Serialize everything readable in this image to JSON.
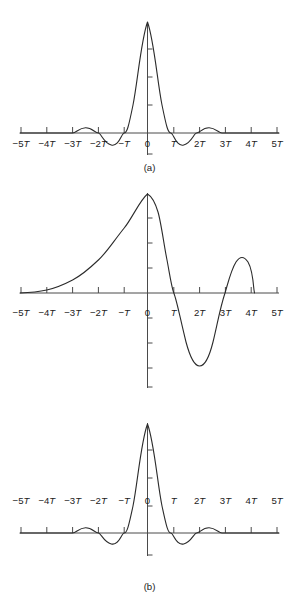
{
  "figure": {
    "panels": [
      {
        "id": "a",
        "caption": "(a)"
      },
      {
        "id": "b",
        "caption": "(b)"
      },
      {
        "id": "c",
        "caption": "(c)"
      }
    ]
  },
  "axis": {
    "tick_labels": [
      "-5T",
      "-4T",
      "-3T",
      "-2T",
      "-T",
      "0",
      "T",
      "2T",
      "3T",
      "4T",
      "5T"
    ],
    "tick_values": [
      -5,
      -4,
      -3,
      -2,
      -1,
      0,
      1,
      2,
      3,
      4,
      5
    ],
    "line_color": "#4a4a4a",
    "curve_color": "#2b2b2b"
  },
  "chart_data": [
    {
      "type": "line",
      "title": "(a)",
      "xlabel": "",
      "ylabel": "",
      "xlim": [
        -5,
        5
      ],
      "ylim": [
        -0.25,
        1.05
      ],
      "grid": false,
      "legend": "none",
      "xtick_labels": [
        "-5T",
        "-4T",
        "-3T",
        "-2T",
        "-T",
        "0",
        "T",
        "2T",
        "3T",
        "4T",
        "5T"
      ],
      "xtick_values": [
        -5,
        -4,
        -3,
        -2,
        -1,
        0,
        1,
        2,
        3,
        4,
        5
      ],
      "description": "Symmetric sinc-squared-like impulse response: main lobe peaking at 1.0 at t=0 with zero crossings near -1.15T and 1.15T, small negative sidelobes near -1.5T and 1.5T, small positive sidelobes near -2.5T and 2.5T, decaying to zero beyond 3T.",
      "x": [
        -5.0,
        -4.5,
        -4.0,
        -3.5,
        -3.0,
        -2.8,
        -2.5,
        -2.2,
        -2.0,
        -1.8,
        -1.6,
        -1.5,
        -1.3,
        -1.15,
        -1.0,
        -0.8,
        -0.6,
        -0.4,
        -0.2,
        0.0,
        0.2,
        0.4,
        0.6,
        0.8,
        1.0,
        1.15,
        1.3,
        1.5,
        1.6,
        1.8,
        2.0,
        2.2,
        2.5,
        2.8,
        3.0,
        3.5,
        4.0,
        4.5,
        5.0
      ],
      "y": [
        0.0,
        0.0,
        0.0,
        0.0,
        0.0,
        0.03,
        0.07,
        0.04,
        0.0,
        -0.06,
        -0.1,
        -0.1,
        -0.07,
        0.0,
        0.12,
        0.35,
        0.6,
        0.82,
        0.97,
        1.0,
        0.97,
        0.82,
        0.6,
        0.35,
        0.12,
        0.0,
        -0.07,
        -0.1,
        -0.1,
        -0.06,
        0.0,
        0.04,
        0.07,
        0.03,
        0.0,
        0.0,
        0.0,
        0.0,
        0.0
      ]
    },
    {
      "type": "line",
      "title": "(b)",
      "xlabel": "",
      "ylabel": "",
      "xlim": [
        -5,
        5
      ],
      "ylim": [
        -0.95,
        1.05
      ],
      "grid": false,
      "legend": "none",
      "xtick_labels": [
        "-5T",
        "-4T",
        "-3T",
        "-2T",
        "-T",
        "0",
        "T",
        "2T",
        "3T",
        "4T",
        "5T"
      ],
      "xtick_values": [
        -5,
        -4,
        -3,
        -2,
        -1,
        0,
        1,
        2,
        3,
        4,
        5
      ],
      "description": "Asymmetric (non-causal-looking) waveform: slow rise from zero at -5T, peak of 1.0 just after t=0, steep fall crossing zero near 1.15T, deep negative trough of about -0.75 near 1.9T, rise through zero near 2.6T to a secondary peak of about 0.43 near 3.05T, then an abrupt drop to zero at about 3.5T.",
      "x": [
        -5.0,
        -4.5,
        -4.0,
        -3.5,
        -3.0,
        -2.6,
        -2.2,
        -1.8,
        -1.4,
        -1.0,
        -0.7,
        -0.4,
        -0.2,
        0.0,
        0.15,
        0.3,
        0.5,
        0.7,
        0.9,
        1.15,
        1.35,
        1.6,
        1.9,
        2.1,
        2.3,
        2.6,
        2.8,
        3.05,
        3.25,
        3.45,
        3.5
      ],
      "y": [
        0.0,
        0.01,
        0.03,
        0.06,
        0.11,
        0.17,
        0.25,
        0.36,
        0.5,
        0.66,
        0.79,
        0.92,
        0.98,
        1.0,
        1.0,
        0.97,
        0.85,
        0.66,
        0.38,
        0.0,
        -0.3,
        -0.6,
        -0.75,
        -0.7,
        -0.5,
        0.0,
        0.25,
        0.43,
        0.36,
        0.05,
        0.0
      ]
    },
    {
      "type": "line",
      "title": "(c)",
      "xlabel": "",
      "ylabel": "",
      "xlim": [
        -5,
        5
      ],
      "ylim": [
        -0.25,
        1.05
      ],
      "grid": false,
      "legend": "none",
      "xtick_labels": [
        "-5T",
        "-4T",
        "-3T",
        "-2T",
        "-T",
        "0",
        "T",
        "2T",
        "3T",
        "4T",
        "5T"
      ],
      "xtick_values": [
        -5,
        -4,
        -3,
        -2,
        -1,
        0,
        1,
        2,
        3,
        4,
        5
      ],
      "description": "Symmetric raised-cosine-like impulse response nearly identical to (a): main lobe peaking at 1.0 at t=0, zero crossings near -1.2T and 1.2T, shallow negative sidelobes near 1.55T, small positive sidelobes near 2.5T, decaying to zero past 3T.",
      "x": [
        -5.0,
        -4.5,
        -4.0,
        -3.5,
        -3.0,
        -2.8,
        -2.5,
        -2.2,
        -2.0,
        -1.8,
        -1.6,
        -1.45,
        -1.3,
        -1.2,
        -1.0,
        -0.8,
        -0.6,
        -0.4,
        -0.2,
        0.0,
        0.2,
        0.4,
        0.6,
        0.8,
        1.0,
        1.2,
        1.3,
        1.45,
        1.6,
        1.8,
        2.0,
        2.2,
        2.5,
        2.8,
        3.0,
        3.5,
        4.0,
        4.5,
        5.0
      ],
      "y": [
        0.0,
        0.0,
        0.0,
        0.0,
        0.0,
        0.03,
        0.07,
        0.04,
        0.0,
        -0.05,
        -0.09,
        -0.1,
        -0.08,
        0.0,
        0.13,
        0.37,
        0.62,
        0.84,
        0.98,
        1.0,
        0.98,
        0.84,
        0.62,
        0.37,
        0.13,
        0.0,
        -0.08,
        -0.1,
        -0.09,
        -0.05,
        0.0,
        0.04,
        0.07,
        0.03,
        0.0,
        0.0,
        0.0,
        0.0,
        0.0
      ]
    }
  ]
}
